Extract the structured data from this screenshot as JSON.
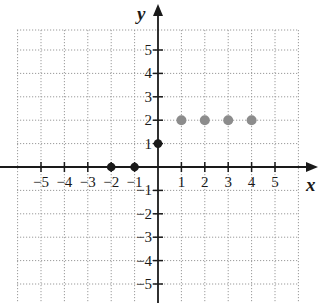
{
  "chart_data": {
    "type": "scatter",
    "title": "",
    "xlabel": "x",
    "ylabel": "y",
    "xlim": [
      -6,
      6
    ],
    "ylim": [
      -6,
      6
    ],
    "grid": true,
    "x_ticks": [
      -5,
      -4,
      -3,
      -2,
      -1,
      1,
      2,
      3,
      4,
      5
    ],
    "y_ticks": [
      5,
      4,
      3,
      2,
      1,
      -1,
      -2,
      -3,
      -4,
      -5
    ],
    "x_tick_labels": [
      "−5",
      "−4",
      "−3",
      "−2",
      "−1",
      "1",
      "2",
      "3",
      "4",
      "5"
    ],
    "y_tick_labels": [
      "5",
      "4",
      "3",
      "2",
      "1",
      "−1",
      "−2",
      "−3",
      "−4",
      "−5"
    ],
    "series": [
      {
        "name": "gray points",
        "color": "#8c8c8c",
        "points": [
          [
            1,
            2
          ],
          [
            2,
            2
          ],
          [
            3,
            2
          ],
          [
            4,
            2
          ]
        ]
      },
      {
        "name": "black points",
        "color": "#1a1a1a",
        "points": [
          [
            -2,
            0
          ],
          [
            -1,
            0
          ],
          [
            0,
            1
          ]
        ]
      }
    ]
  },
  "colors": {
    "axis": "#1a1a1a",
    "grid": "#9a9a9a",
    "gray_point": "#8c8c8c",
    "black_point": "#1a1a1a"
  }
}
